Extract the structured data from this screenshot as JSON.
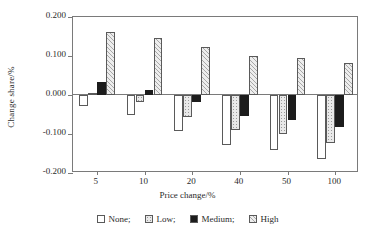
{
  "chart_data": {
    "type": "bar",
    "title": "",
    "xlabel": "Price change/%",
    "ylabel": "Change share/%",
    "categories": [
      "5",
      "10",
      "20",
      "40",
      "50",
      "100"
    ],
    "ylim": [
      -0.2,
      0.2
    ],
    "yticks": [
      "0.200",
      "0.100",
      "0.000",
      "-0.100",
      "-0.200"
    ],
    "ytick_values": [
      0.2,
      0.1,
      0.0,
      -0.1,
      -0.2
    ],
    "grid": false,
    "legend_position": "bottom",
    "series": [
      {
        "name": "None;",
        "values": [
          -0.027,
          -0.052,
          -0.092,
          -0.128,
          -0.142,
          -0.164
        ]
      },
      {
        "name": "Low;",
        "values": [
          0.006,
          -0.019,
          -0.056,
          -0.091,
          -0.101,
          -0.123
        ]
      },
      {
        "name": "Medium;",
        "values": [
          0.034,
          0.014,
          -0.019,
          -0.053,
          -0.064,
          -0.081
        ]
      },
      {
        "name": "High",
        "values": [
          0.161,
          0.147,
          0.122,
          0.099,
          0.094,
          0.083
        ]
      }
    ]
  },
  "legend": {
    "items": [
      {
        "label": "None;",
        "swatch": "swatch-none"
      },
      {
        "label": "Low;",
        "swatch": "swatch-low"
      },
      {
        "label": "Medium;",
        "swatch": "swatch-medium"
      },
      {
        "label": "High",
        "swatch": "swatch-high"
      }
    ]
  },
  "colors": {
    "axis": "#7a7a7a",
    "bar_outline": "#5a5a5a",
    "none_fill": "#ffffff",
    "low_fill": "#e9e9e9",
    "medium_fill": "#1c1c1c",
    "high_fill": "#ededed",
    "text": "#2b2b2b"
  }
}
